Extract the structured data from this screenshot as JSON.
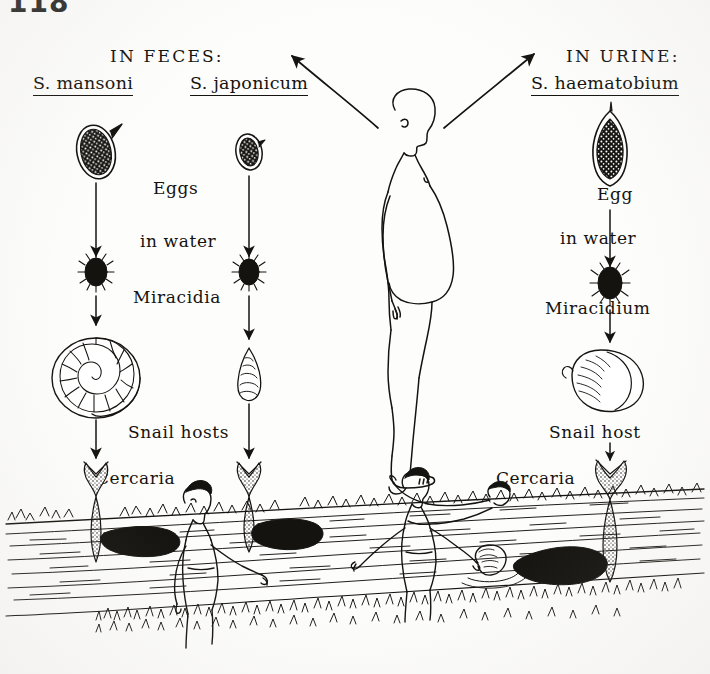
{
  "page": {
    "folio": "118",
    "running_head": "ANIMALS AND THEIR DISEASES",
    "figure_title": "Schistosome life cycle"
  },
  "columns": {
    "feces": {
      "route_label": "IN FECES:",
      "species": [
        {
          "name": "S. mansoni",
          "egg_spine": "lateral",
          "snail": "biomphalaria-flat-spiral"
        },
        {
          "name": "S. japonicum",
          "egg_spine": "small-lateral-knob",
          "snail": "oncomelania-conical"
        }
      ],
      "stage_labels": {
        "egg": "Eggs",
        "water": "in water",
        "miracidium": "Miracidia",
        "snail": "Snail hosts",
        "cercaria": "Cercaria"
      }
    },
    "urine": {
      "route_label": "IN URINE:",
      "species": [
        {
          "name": "S. haematobium",
          "egg_spine": "terminal",
          "snail": "bulinus-globose"
        }
      ],
      "stage_labels": {
        "egg": "Egg",
        "water": "in water",
        "miracidium": "Miracidium",
        "snail": "Snail host",
        "cercaria": "Cercaria"
      }
    }
  },
  "center": {
    "human_figure": "standing-child-profile-distended-abdomen",
    "arrow_left": "curved-arrow-to-feces-column",
    "arrow_right": "curved-arrow-to-urine-column"
  },
  "water_scene": {
    "description": "children bathing and swimming in a river with grassy banks",
    "figures": [
      "standing-child-left",
      "wading-child-center",
      "swimming-child-surface",
      "head-above-water-child"
    ],
    "cercaria_count": 3
  },
  "colors": {
    "ink": "#15130f",
    "paper": "#fdfdfc",
    "runhead": "#b9b6b1",
    "folio": "#2b2b2b"
  }
}
